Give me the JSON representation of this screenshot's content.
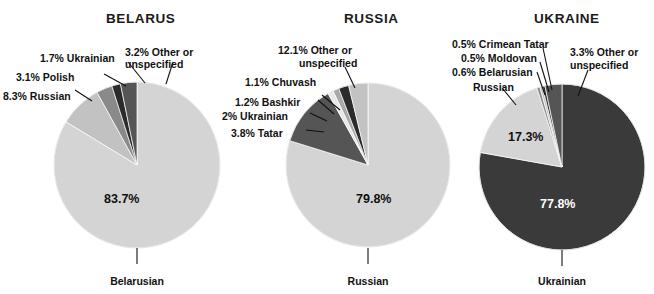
{
  "figure": {
    "background": "#ffffff",
    "width": 654,
    "height": 294
  },
  "palette": {
    "major_light": "#d4d4d4",
    "major_dark": "#3a3a3a",
    "mid_light": "#c2c2c2",
    "mid": "#a8a8a8",
    "mid_dark": "#8a8a8a",
    "dark": "#555555",
    "near_black": "#2b2b2b",
    "text": "#111111",
    "text_on_dark": "#ffffff",
    "leader": "#111111"
  },
  "charts": [
    {
      "id": "belarus",
      "title": "BELARUS",
      "title_x": 106,
      "title_y": 11,
      "cx": 137,
      "cy": 165,
      "r": 83,
      "bottom_label": "Belarusian",
      "bottom_label_x": 137,
      "bottom_label_y": 275,
      "inside_value": "83.7%",
      "inside_value_x": 104,
      "inside_value_y": 192,
      "slices": [
        {
          "name": "Belarusian",
          "value": 83.7,
          "color": "#d4d4d4",
          "label": "83.7%",
          "inside": true
        },
        {
          "name": "Russian",
          "value": 8.3,
          "color": "#c2c2c2",
          "label": "8.3% Russian",
          "inside": false
        },
        {
          "name": "Polish",
          "value": 3.1,
          "color": "#8a8a8a",
          "label": "3.1% Polish",
          "inside": false
        },
        {
          "name": "Ukrainian",
          "value": 1.7,
          "color": "#2b2b2b",
          "label": "1.7% Ukrainian",
          "inside": false
        },
        {
          "name": "Other or unspecified",
          "value": 3.2,
          "color": "#555555",
          "label": "3.2% Other or unspecified",
          "inside": false
        }
      ],
      "callouts": [
        {
          "key": "russian",
          "text": "8.3% Russian",
          "x": 3,
          "y": 90,
          "align": "left"
        },
        {
          "key": "polish",
          "text": "3.1% Polish",
          "x": 16,
          "y": 71,
          "align": "left"
        },
        {
          "key": "ukrainian",
          "text": "1.7% Ukrainian",
          "x": 40,
          "y": 52,
          "align": "left"
        },
        {
          "key": "other",
          "text": "3.2% Other or",
          "x": 125,
          "y": 46,
          "align": "left"
        },
        {
          "key": "other2",
          "text": "unspecified",
          "x": 125,
          "y": 58,
          "align": "left"
        }
      ]
    },
    {
      "id": "russia",
      "title": "RUSSIA",
      "title_x": 344,
      "title_y": 11,
      "cx": 368,
      "cy": 165,
      "r": 82,
      "bottom_label": "Russian",
      "bottom_label_x": 368,
      "bottom_label_y": 275,
      "inside_value": "79.8%",
      "inside_value_x": 356,
      "inside_value_y": 192,
      "slices": [
        {
          "name": "Russian",
          "value": 79.8,
          "color": "#d4d4d4",
          "label": "79.8%",
          "inside": true
        },
        {
          "name": "Other or unspecified",
          "value": 12.1,
          "color": "#555555",
          "label": "12.1% Other or unspecified",
          "inside": false
        },
        {
          "name": "Chuvash",
          "value": 1.1,
          "color": "#e8e8e8",
          "label": "1.1% Chuvash",
          "inside": false
        },
        {
          "name": "Bashkir",
          "value": 1.2,
          "color": "#a8a8a8",
          "label": "1.2% Bashkir",
          "inside": false
        },
        {
          "name": "Ukrainian",
          "value": 2.0,
          "color": "#2b2b2b",
          "label": "2% Ukrainian",
          "inside": false
        },
        {
          "name": "Tatar",
          "value": 3.8,
          "color": "#c2c2c2",
          "label": "3.8% Tatar",
          "inside": false
        }
      ],
      "callouts": [
        {
          "key": "other",
          "text": "12.1% Other or",
          "x": 278,
          "y": 44,
          "align": "left"
        },
        {
          "key": "other2",
          "text": "unspecified",
          "x": 299,
          "y": 57,
          "align": "left"
        },
        {
          "key": "chuvash",
          "text": "1.1% Chuvash",
          "x": 245,
          "y": 76,
          "align": "left"
        },
        {
          "key": "bashkir",
          "text": "1.2% Bashkir",
          "x": 235,
          "y": 96,
          "align": "left"
        },
        {
          "key": "ukrainian",
          "text": "2% Ukrainian",
          "x": 222,
          "y": 110,
          "align": "left"
        },
        {
          "key": "tatar",
          "text": "3.8% Tatar",
          "x": 231,
          "y": 127,
          "align": "left"
        }
      ]
    },
    {
      "id": "ukraine",
      "title": "UKRAINE",
      "title_x": 534,
      "title_y": 11,
      "cx": 562,
      "cy": 167,
      "r": 83,
      "bottom_label": "Ukrainian",
      "bottom_label_x": 562,
      "bottom_label_y": 275,
      "inside_value": "77.8%",
      "inside_value_x": 562,
      "inside_value_y": 197,
      "slices": [
        {
          "name": "Ukrainian",
          "value": 77.8,
          "color": "#3a3a3a",
          "label": "77.8%",
          "inside": true
        },
        {
          "name": "Russian",
          "value": 17.3,
          "color": "#d4d4d4",
          "label": "17.3%",
          "inside": true
        },
        {
          "name": "Belarusian",
          "value": 0.6,
          "color": "#8a8a8a",
          "label": "0.6% Belarusian",
          "inside": false
        },
        {
          "name": "Moldovan",
          "value": 0.5,
          "color": "#c2c2c2",
          "label": "0.5% Moldovan",
          "inside": false
        },
        {
          "name": "Crimean Tatar",
          "value": 0.5,
          "color": "#2b2b2b",
          "label": "0.5% Crimean Tatar",
          "inside": false
        },
        {
          "name": "Other or unspecified",
          "value": 3.3,
          "color": "#555555",
          "label": "3.3% Other or unspecified",
          "inside": false
        }
      ],
      "inside_value_2": "17.3%",
      "inside_value_2_x": 508,
      "inside_value_2_y": 130,
      "callouts": [
        {
          "key": "crimean",
          "text": "0.5% Crimean Tatar",
          "x": 452,
          "y": 38,
          "align": "left"
        },
        {
          "key": "moldovan",
          "text": "0.5% Moldovan",
          "x": 461,
          "y": 52,
          "align": "left"
        },
        {
          "key": "belarusian",
          "text": "0.6% Belarusian",
          "x": 452,
          "y": 66,
          "align": "left"
        },
        {
          "key": "russian",
          "text": "Russian",
          "x": 473,
          "y": 81,
          "align": "left"
        },
        {
          "key": "other",
          "text": "3.3% Other or",
          "x": 570,
          "y": 46,
          "align": "left"
        },
        {
          "key": "other2",
          "text": "unspecified",
          "x": 570,
          "y": 59,
          "align": "left"
        }
      ]
    }
  ],
  "chart_data": {
    "type": "pie",
    "legend_position": "none",
    "grid": false,
    "panels": [
      {
        "title": "BELARUS",
        "labels": [
          "Belarusian",
          "Russian",
          "Polish",
          "Ukrainian",
          "Other or unspecified"
        ],
        "values": [
          83.7,
          8.3,
          3.1,
          1.7,
          3.2
        ],
        "unit": "%",
        "colors": [
          "#d4d4d4",
          "#c2c2c2",
          "#8a8a8a",
          "#2b2b2b",
          "#555555"
        ]
      },
      {
        "title": "RUSSIA",
        "labels": [
          "Russian",
          "Tatar",
          "Ukrainian",
          "Bashkir",
          "Chuvash",
          "Other or unspecified"
        ],
        "values": [
          79.8,
          3.8,
          2.0,
          1.2,
          1.1,
          12.1
        ],
        "unit": "%",
        "colors": [
          "#d4d4d4",
          "#c2c2c2",
          "#2b2b2b",
          "#a8a8a8",
          "#e8e8e8",
          "#555555"
        ]
      },
      {
        "title": "UKRAINE",
        "labels": [
          "Ukrainian",
          "Russian",
          "Belarusian",
          "Moldovan",
          "Crimean Tatar",
          "Other or unspecified"
        ],
        "values": [
          77.8,
          17.3,
          0.6,
          0.5,
          0.5,
          3.3
        ],
        "unit": "%",
        "colors": [
          "#3a3a3a",
          "#d4d4d4",
          "#8a8a8a",
          "#c2c2c2",
          "#2b2b2b",
          "#555555"
        ]
      }
    ]
  }
}
